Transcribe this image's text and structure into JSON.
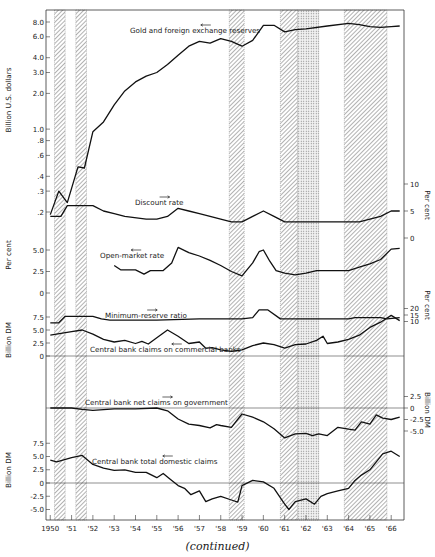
{
  "caption": "(continued)",
  "chart_data": {
    "type": "line",
    "title": "",
    "x_axis": {
      "ticks": [
        "1950",
        "'51",
        "'52",
        "'53",
        "'54",
        "'55",
        "'56",
        "'57",
        "'58",
        "'59",
        "'60",
        "'61",
        "'62",
        "'63",
        "'64",
        "'65",
        "'66"
      ],
      "range": [
        1950,
        1966.5
      ]
    },
    "shaded_periods": [
      {
        "start": 1950.2,
        "end": 1950.7,
        "pattern": "hatched"
      },
      {
        "start": 1951.2,
        "end": 1951.7,
        "pattern": "hatched"
      },
      {
        "start": 1958.4,
        "end": 1959.1,
        "pattern": "hatched"
      },
      {
        "start": 1960.8,
        "end": 1961.6,
        "pattern": "hatched"
      },
      {
        "start": 1961.6,
        "end": 1962.6,
        "pattern": "dotted"
      },
      {
        "start": 1963.8,
        "end": 1965.8,
        "pattern": "hatched"
      }
    ],
    "panels": [
      {
        "name": "Gold and foreign exchange reserves",
        "ylabel": "Billion U.S. dollars",
        "scale": "log",
        "axis_side": "left",
        "yticks": [
          "8.0",
          "6.0",
          "4.0",
          "3.0",
          "2.0",
          "1.0",
          ".8",
          ".6",
          ".4",
          ".3",
          ".2"
        ],
        "arrow": "left",
        "x": [
          1950.0,
          1950.4,
          1950.8,
          1951.3,
          1951.6,
          1952.0,
          1952.5,
          1953.0,
          1953.5,
          1954.0,
          1954.5,
          1955.0,
          1955.5,
          1956.0,
          1956.5,
          1957.0,
          1957.5,
          1958.0,
          1958.5,
          1959.0,
          1959.5,
          1960.0,
          1960.5,
          1961.0,
          1961.5,
          1962.0,
          1963.0,
          1964.0,
          1964.5,
          1965.0,
          1965.5,
          1966.0,
          1966.4
        ],
        "values": [
          0.19,
          0.3,
          0.24,
          0.48,
          0.47,
          0.95,
          1.15,
          1.6,
          2.1,
          2.5,
          2.8,
          3.0,
          3.5,
          4.2,
          5.0,
          5.5,
          5.3,
          5.8,
          5.5,
          5.0,
          5.6,
          7.5,
          7.5,
          6.6,
          6.9,
          7.0,
          7.4,
          7.8,
          7.6,
          7.3,
          7.2,
          7.3,
          7.4
        ]
      },
      {
        "name": "Discount rate",
        "ylabel": "Per cent",
        "axis_side": "right",
        "yticks": [
          "10",
          "5",
          "0"
        ],
        "arrow": "right",
        "x": [
          1950.0,
          1950.5,
          1950.8,
          1951.0,
          1952.0,
          1952.5,
          1953.0,
          1953.5,
          1954.5,
          1955.0,
          1955.5,
          1956.0,
          1956.5,
          1957.0,
          1957.5,
          1958.0,
          1958.5,
          1959.0,
          1959.5,
          1960.0,
          1960.5,
          1961.0,
          1962.0,
          1963.0,
          1964.0,
          1964.5,
          1965.0,
          1965.5,
          1966.0,
          1966.4
        ],
        "values": [
          4,
          4,
          6,
          6,
          6,
          5,
          4.5,
          4,
          3.5,
          3.5,
          4,
          5.5,
          5,
          4.5,
          4,
          3.5,
          3,
          3,
          4,
          5,
          4,
          3,
          3,
          3,
          3,
          3,
          3.5,
          4,
          5,
          5
        ]
      },
      {
        "name": "Open-market rate",
        "ylabel": "Per cent",
        "axis_side": "left",
        "yticks": [
          "5.0",
          "2.5",
          "0"
        ],
        "arrow": "left",
        "x": [
          1953.0,
          1953.3,
          1954.0,
          1954.4,
          1954.7,
          1955.3,
          1955.7,
          1956.0,
          1956.5,
          1957.0,
          1957.5,
          1958.0,
          1958.5,
          1959.0,
          1959.5,
          1959.8,
          1960.0,
          1960.3,
          1960.6,
          1961.0,
          1961.5,
          1962.0,
          1962.5,
          1963.0,
          1964.0,
          1964.5,
          1965.0,
          1965.5,
          1966.0,
          1966.4
        ],
        "values": [
          3.2,
          2.7,
          2.7,
          2.2,
          2.6,
          2.6,
          3.5,
          5.3,
          4.7,
          4.3,
          3.8,
          3.2,
          2.5,
          2.0,
          3.5,
          4.8,
          5.0,
          3.7,
          2.6,
          2.3,
          2.1,
          2.3,
          2.6,
          2.6,
          2.6,
          3.0,
          3.4,
          3.9,
          5.1,
          5.2
        ]
      },
      {
        "name": "Minimum-reserve ratio",
        "ylabel": "Per cent",
        "axis_side": "right",
        "yticks": [
          "20",
          "15",
          "10"
        ],
        "arrow": "right",
        "x": [
          1950.0,
          1950.4,
          1950.7,
          1952.0,
          1952.4,
          1952.8,
          1954.0,
          1955.0,
          1957.0,
          1959.0,
          1959.5,
          1959.8,
          1960.2,
          1960.8,
          1963.0,
          1964.0,
          1964.3,
          1965.5,
          1965.8,
          1966.4
        ],
        "values": [
          9,
          9,
          14,
          14,
          12,
          11,
          11,
          11,
          12,
          12,
          13,
          19,
          19,
          12,
          12,
          12,
          13,
          13,
          12,
          13
        ]
      },
      {
        "name": "Central bank claims on commercial banks",
        "ylabel": "Billion DM",
        "axis_side": "left",
        "yticks": [
          "7.5",
          "5.0",
          "2.5",
          "0"
        ],
        "arrow": "left",
        "x": [
          1950.0,
          1951.0,
          1951.5,
          1952.0,
          1952.5,
          1953.0,
          1953.5,
          1954.0,
          1954.3,
          1954.6,
          1955.0,
          1955.5,
          1956.0,
          1956.5,
          1957.0,
          1957.3,
          1957.6,
          1958.0,
          1958.5,
          1959.0,
          1959.5,
          1960.0,
          1960.5,
          1961.0,
          1961.5,
          1962.0,
          1962.5,
          1962.8,
          1963.0,
          1963.5,
          1964.0,
          1964.5,
          1965.0,
          1965.5,
          1966.0,
          1966.4
        ],
        "values": [
          4.0,
          4.7,
          5.0,
          4.2,
          3.2,
          2.7,
          3.0,
          2.4,
          2.8,
          2.3,
          3.5,
          5.0,
          3.8,
          2.4,
          2.7,
          1.5,
          1.6,
          1.2,
          0.9,
          1.2,
          2.0,
          2.5,
          2.2,
          1.5,
          2.2,
          2.3,
          3.0,
          3.8,
          2.4,
          2.7,
          3.2,
          4.0,
          5.5,
          6.5,
          7.8,
          6.8
        ]
      },
      {
        "name": "Central bank net claims on government",
        "ylabel": "Billion DM",
        "axis_side": "right",
        "yticks": [
          "2.5",
          "0",
          "-2.5",
          "-5.0"
        ],
        "arrow": "right",
        "x": [
          1950.0,
          1951.0,
          1951.5,
          1952.0,
          1953.0,
          1954.0,
          1955.0,
          1955.5,
          1956.0,
          1956.5,
          1957.0,
          1957.5,
          1957.8,
          1958.0,
          1958.5,
          1959.0,
          1959.5,
          1960.0,
          1960.5,
          1961.0,
          1961.5,
          1962.0,
          1962.3,
          1962.6,
          1963.0,
          1963.5,
          1964.0,
          1964.3,
          1964.6,
          1965.0,
          1965.3,
          1965.6,
          1966.0,
          1966.4
        ],
        "values": [
          0,
          0,
          -0.3,
          -0.5,
          -0.2,
          -0.2,
          0,
          -0.6,
          -2.4,
          -3.5,
          -3.8,
          -4.3,
          -3.6,
          -3.8,
          -4.2,
          -1.3,
          -2.0,
          -3.0,
          -4.5,
          -6.5,
          -5.6,
          -5.5,
          -6.0,
          -5.6,
          -6.0,
          -4.2,
          -4.6,
          -4.8,
          -3.0,
          -3.5,
          -1.5,
          -2.2,
          -2.5,
          -2.0
        ]
      },
      {
        "name": "Central bank total domestic claims",
        "ylabel": "Billion DM",
        "axis_side": "left",
        "yticks": [
          "7.5",
          "5.0",
          "2.5",
          "0",
          "-2.5",
          "-5.0"
        ],
        "arrow": "left",
        "x": [
          1950.0,
          1950.3,
          1951.0,
          1951.5,
          1952.0,
          1952.5,
          1953.0,
          1953.5,
          1954.0,
          1954.5,
          1955.0,
          1955.3,
          1955.6,
          1956.0,
          1956.3,
          1956.6,
          1957.0,
          1957.3,
          1957.6,
          1958.0,
          1958.5,
          1958.8,
          1959.0,
          1959.5,
          1960.0,
          1960.5,
          1961.0,
          1961.2,
          1961.5,
          1962.0,
          1962.4,
          1962.7,
          1963.0,
          1963.5,
          1964.0,
          1964.3,
          1964.6,
          1965.0,
          1965.3,
          1965.6,
          1966.0,
          1966.4
        ],
        "values": [
          4.3,
          4.0,
          4.8,
          5.2,
          3.5,
          2.8,
          2.4,
          2.5,
          2.0,
          2.0,
          1.0,
          1.8,
          0.8,
          -0.5,
          -1.0,
          -2.2,
          -1.5,
          -3.5,
          -3.0,
          -2.5,
          -3.2,
          -3.6,
          -0.5,
          0.5,
          0.2,
          -1.0,
          -4.0,
          -5.0,
          -3.5,
          -3.0,
          -4.0,
          -2.5,
          -2.0,
          -1.5,
          -1.0,
          0.5,
          1.5,
          2.5,
          4.0,
          5.5,
          6.0,
          5.0
        ]
      }
    ]
  }
}
